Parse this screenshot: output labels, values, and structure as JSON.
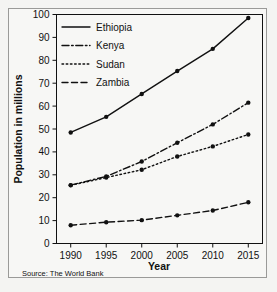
{
  "figure": {
    "source_note": "Source: The World Bank"
  },
  "chart_data": {
    "type": "line",
    "title": "",
    "xlabel": "Year",
    "ylabel": "Population in millions",
    "x": [
      1990,
      1995,
      2000,
      2005,
      2010,
      2015
    ],
    "xtick_labels": [
      "1990",
      "1995",
      "2000",
      "2005",
      "2010",
      "2015"
    ],
    "xlim": [
      1988,
      2017
    ],
    "ylim": [
      0,
      100
    ],
    "ytick_values": [
      0,
      10,
      20,
      30,
      40,
      50,
      60,
      70,
      80,
      90,
      100
    ],
    "ytick_labels": [
      "0",
      "10",
      "20",
      "30",
      "40",
      "50",
      "60",
      "70",
      "80",
      "90",
      "100"
    ],
    "grid": false,
    "legend_position": "upper-left",
    "series": [
      {
        "name": "Ethiopia",
        "dash": "none",
        "color": "#111111",
        "values": [
          48.5,
          55.3,
          65.3,
          75.3,
          85.0,
          98.5
        ]
      },
      {
        "name": "Kenya",
        "dash": "dashdot",
        "color": "#111111",
        "values": [
          25.5,
          29.3,
          35.8,
          44.0,
          52.0,
          61.5
        ]
      },
      {
        "name": "Sudan",
        "dash": "dotted",
        "color": "#111111",
        "values": [
          25.4,
          28.8,
          32.2,
          38.0,
          42.4,
          47.6
        ]
      },
      {
        "name": "Zambia",
        "dash": "dashed",
        "color": "#111111",
        "values": [
          8.0,
          9.3,
          10.2,
          12.3,
          14.4,
          18.0
        ]
      }
    ]
  }
}
